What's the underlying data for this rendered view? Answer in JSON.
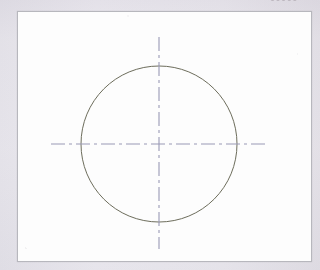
{
  "page": {
    "width": 320,
    "height": 270,
    "background_color": "#f1f0f3",
    "header_fragment_text": "•••••"
  },
  "frame": {
    "label": "drawing-border",
    "x": 17,
    "y": 11,
    "width": 295,
    "height": 251,
    "fill_color": "#fdfdfd",
    "border_color": "#b7b7bd",
    "border_width": 1
  },
  "drawing": {
    "title": "Circle with centerlines",
    "type": "technical-drawing",
    "center": {
      "x": 141,
      "y": 132
    },
    "circle": {
      "label": "circle-outline",
      "radius": 78,
      "stroke_color": "#6d6d5c",
      "stroke_width": 1,
      "fill": "none",
      "left_edge_x": 63,
      "right_edge_x": 219,
      "top_edge_y": 54,
      "bottom_edge_y": 210
    },
    "centerlines": {
      "label": "centerline-cross",
      "stroke_color": "#9a9ab6",
      "stroke_width": 1.1,
      "dash_pattern": "14 4 3 4",
      "horizontal": {
        "label": "horizontal-centerline",
        "x1": 33,
        "x2": 250,
        "y": 132
      },
      "vertical": {
        "label": "vertical-centerline",
        "y1": 25,
        "y2": 237,
        "x": 141
      }
    }
  },
  "chart_data": {
    "type": "scatter",
    "xlabel": "",
    "ylabel": "",
    "shapes": [
      {
        "name": "circle",
        "cx": 141,
        "cy": 132,
        "r": 78,
        "stroke": "#6d6d5c",
        "fill": "none"
      },
      {
        "name": "horizontal-centerline",
        "x1": 33,
        "y1": 132,
        "x2": 250,
        "y2": 132,
        "stroke": "#9a9ab6",
        "dash": "14 4 3 4"
      },
      {
        "name": "vertical-centerline",
        "x1": 141,
        "y1": 25,
        "x2": 141,
        "y2": 237,
        "stroke": "#9a9ab6",
        "dash": "14 4 3 4"
      }
    ]
  }
}
